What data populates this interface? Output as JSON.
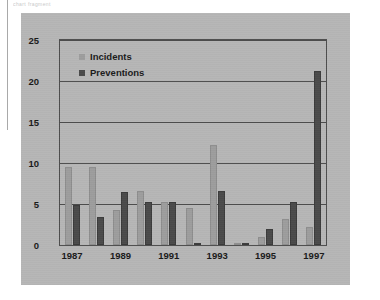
{
  "page": {
    "header_fragment": "chart fragment"
  },
  "chart_data": {
    "type": "bar",
    "title": "",
    "xlabel": "",
    "ylabel": "",
    "ylim": [
      0,
      25
    ],
    "yticks": [
      0,
      5,
      10,
      15,
      20,
      25
    ],
    "ytick_labels": [
      "0",
      "5",
      "10",
      "15",
      "20",
      "25"
    ],
    "grid": true,
    "legend_position": "top-left",
    "categories": [
      "1987",
      "1988",
      "1989",
      "1990",
      "1991",
      "1992",
      "1993",
      "1994",
      "1995",
      "1996",
      "1997"
    ],
    "xtick_labels": [
      "1987",
      "1989",
      "1991",
      "1993",
      "1995",
      "1997"
    ],
    "xtick_categories": [
      "1987",
      "1989",
      "1991",
      "1993",
      "1995",
      "1997"
    ],
    "series": [
      {
        "name": "Incidents",
        "color": "#9d9d9d",
        "values": [
          9.5,
          9.5,
          4.3,
          6.6,
          5.2,
          4.5,
          12.2,
          0.3,
          1.0,
          3.2,
          2.2
        ]
      },
      {
        "name": "Preventions",
        "color": "#4a4a4a",
        "values": [
          4.9,
          3.4,
          6.5,
          5.2,
          5.2,
          0.3,
          6.6,
          0.3,
          2.0,
          5.2,
          21.2
        ]
      }
    ]
  },
  "colors": {
    "panel_background": "#b6b6b6",
    "axis": "#4d4d4d",
    "text": "#1a1a1a",
    "incidents": "#9d9d9d",
    "preventions": "#4a4a4a"
  }
}
